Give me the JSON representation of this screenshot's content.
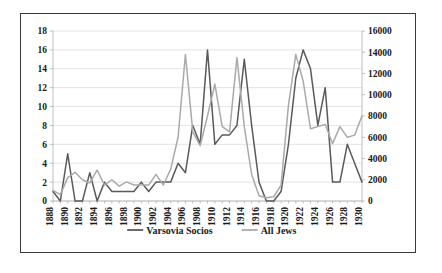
{
  "chart_data": {
    "type": "line",
    "title": "",
    "subtitle": "",
    "xlabel": "",
    "ylabel": "",
    "grid": true,
    "legend_position": "bottom",
    "x": [
      1888,
      1889,
      1890,
      1891,
      1892,
      1893,
      1894,
      1895,
      1896,
      1897,
      1898,
      1899,
      1900,
      1901,
      1902,
      1903,
      1904,
      1905,
      1906,
      1907,
      1908,
      1909,
      1910,
      1911,
      1912,
      1913,
      1914,
      1915,
      1916,
      1917,
      1918,
      1919,
      1920,
      1921,
      1922,
      1923,
      1924,
      1925,
      1926,
      1927,
      1928,
      1929,
      1930
    ],
    "x_tick_labels": [
      "1888",
      "1890",
      "1892",
      "1894",
      "1896",
      "1898",
      "1900",
      "1902",
      "1904",
      "1906",
      "1908",
      "1910",
      "1912",
      "1914",
      "1916",
      "1918",
      "1920",
      "1922",
      "1924",
      "1926",
      "1928",
      "1930"
    ],
    "x_tick_step": 2,
    "xlim": [
      1888,
      1930
    ],
    "left_axis": {
      "label": "",
      "ylim": [
        0,
        18
      ],
      "tick_step": 2,
      "ticks": [
        0,
        2,
        4,
        6,
        8,
        10,
        12,
        14,
        16,
        18
      ]
    },
    "right_axis": {
      "label": "",
      "ylim": [
        0,
        16000
      ],
      "tick_step": 2000,
      "ticks": [
        0,
        2000,
        4000,
        6000,
        8000,
        10000,
        12000,
        14000,
        16000
      ]
    },
    "series": [
      {
        "name": "Varsovia Socios",
        "axis": "left",
        "color": "#595a5c",
        "values": [
          1,
          0,
          5,
          0,
          0,
          3,
          0,
          2,
          1,
          1,
          1,
          1,
          2,
          1,
          2,
          2,
          2,
          4,
          3,
          8,
          6,
          16,
          6,
          7,
          7,
          8,
          15,
          8,
          2,
          0,
          0,
          1,
          6,
          13,
          16,
          14,
          8,
          12,
          2,
          2,
          6,
          4,
          2
        ]
      },
      {
        "name": "All Jews",
        "axis": "right",
        "color": "#a8aaac",
        "values": [
          1000,
          600,
          2200,
          2700,
          2000,
          1700,
          2900,
          1500,
          2000,
          1400,
          1800,
          1500,
          1500,
          1500,
          2500,
          1500,
          3000,
          6000,
          13800,
          6500,
          5200,
          8000,
          11000,
          7000,
          6500,
          13500,
          7000,
          2500,
          500,
          300,
          400,
          1500,
          9000,
          13800,
          11300,
          6800,
          7000,
          7200,
          5400,
          7000,
          6000,
          6200,
          8000
        ]
      }
    ]
  },
  "legend": {
    "items": [
      {
        "label": "Varsovia Socios",
        "color": "#595a5c"
      },
      {
        "label": "All Jews",
        "color": "#a8aaac"
      }
    ]
  }
}
